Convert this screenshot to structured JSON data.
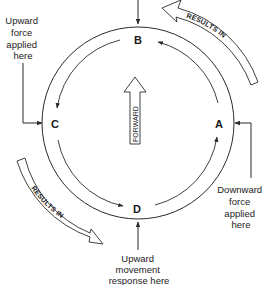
{
  "diagram": {
    "points": {
      "a": "A",
      "b": "B",
      "c": "C",
      "d": "D"
    },
    "center_arrow_label": "FORWARD",
    "band_labels": {
      "top_right": "RESULTS IN",
      "bottom_left": "RESULTS IN"
    },
    "annotations": {
      "upward_force": [
        "Upward",
        "force",
        "applied",
        "here"
      ],
      "downward_force": [
        "Downward",
        "force",
        "applied",
        "here"
      ],
      "upward_movement": [
        "Upward",
        "movement",
        "response here"
      ]
    },
    "colors": {
      "line": "#2a2a2a",
      "background": "#ffffff"
    }
  }
}
